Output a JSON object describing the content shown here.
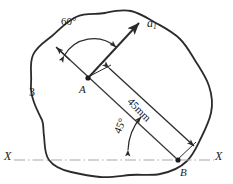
{
  "figure": {
    "labels": {
      "vector_a1": "a",
      "vector_a1_sub": "1",
      "point_a": "A",
      "point_b": "B",
      "axis_left": "X",
      "axis_right": "X",
      "body_number": "3",
      "angle_60": "60°",
      "angle_45": "45°",
      "dimension_45mm": "45mm"
    },
    "colors": {
      "outline": "#2b2b2b",
      "construction": "#3a3a3a",
      "chain_line": "#a8a8a8",
      "text": "#1a1a1a",
      "background": "#ffffff"
    },
    "geometry": {
      "point_a": [
        88,
        78
      ],
      "point_b": [
        178,
        160
      ],
      "a1_tip": [
        140,
        22
      ],
      "ba_extension_tip": [
        56,
        47
      ],
      "angle_between_ba_extension_and_a1": 60,
      "angle_ab_to_axis": 45,
      "length_ab_mm": 45,
      "axis_y": 160
    }
  }
}
